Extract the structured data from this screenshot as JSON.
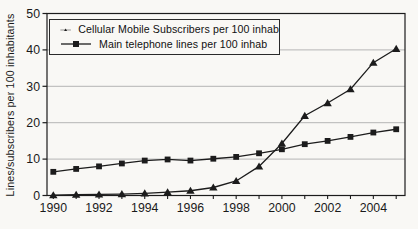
{
  "chart_data": {
    "type": "line",
    "title": "",
    "ylabel": "Lines/subscribers per 100 inhabitants",
    "xlabel": "",
    "ylim": [
      0,
      50
    ],
    "yticks": [
      0,
      10,
      20,
      30,
      40,
      50
    ],
    "x": [
      1990,
      1991,
      1992,
      1993,
      1994,
      1995,
      1996,
      1997,
      1998,
      1999,
      2000,
      2001,
      2002,
      2003,
      2004,
      2005
    ],
    "xtick_labels": [
      1990,
      1992,
      1994,
      1996,
      1998,
      2000,
      2002,
      2004
    ],
    "grid": "horizontal-light",
    "legend_position": "top-left-inside",
    "series": [
      {
        "name": "Cellular Mobile Subscribers per 100 inhab",
        "marker": "triangle",
        "values": [
          0.1,
          0.2,
          0.3,
          0.4,
          0.6,
          0.9,
          1.3,
          2.2,
          4.0,
          8.0,
          14.3,
          21.9,
          25.4,
          29.2,
          36.5,
          40.3
        ]
      },
      {
        "name": "Main telephone lines per 100 inhab",
        "marker": "square",
        "values": [
          6.5,
          7.3,
          8.0,
          8.8,
          9.6,
          9.9,
          9.6,
          10.1,
          10.6,
          11.6,
          12.7,
          14.1,
          15.0,
          16.1,
          17.3,
          18.2
        ]
      }
    ],
    "colors": {
      "line": "#1c1c1c",
      "grid": "#b5b5b5",
      "axis": "#1c1c1c",
      "background": "#f9f8f5",
      "text": "#1a1a1a"
    }
  }
}
